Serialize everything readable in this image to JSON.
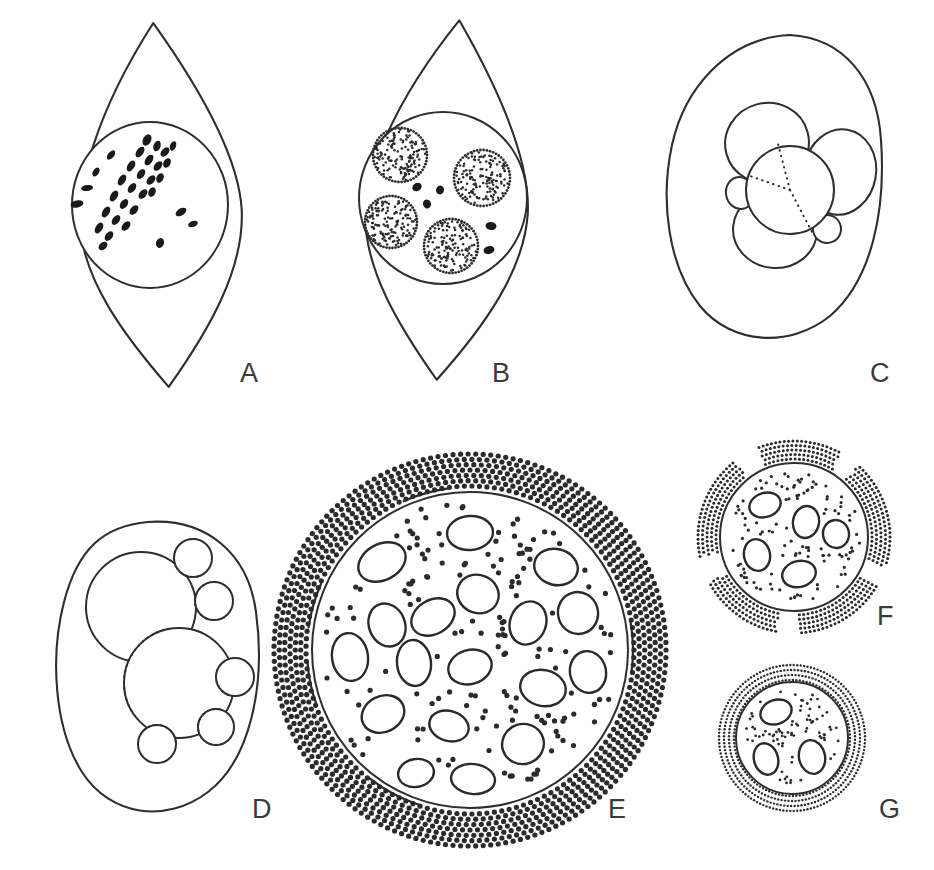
{
  "figure": {
    "panel_count": 7,
    "background_color": "#ffffff",
    "ink_color": "#2e2e2e",
    "width": 934,
    "height": 870
  },
  "panels": [
    {
      "id": "A",
      "label": "A",
      "label_x": 240,
      "label_y": 382,
      "description": "Spindle-shaped cell with circular nucleus containing dark metaphase chromosomes in a diagonal band",
      "cell_shape": "lemon",
      "cell": {
        "cx": 160,
        "cy": 205,
        "rx": 82,
        "ry": 182,
        "rotate": -4
      },
      "nucleus": {
        "cx": 150,
        "cy": 205,
        "rx": 78,
        "ry": 83
      },
      "chromosomes": [
        {
          "x": 111,
          "y": 155,
          "w": 11,
          "h": 6,
          "r": -50
        },
        {
          "x": 96,
          "y": 172,
          "w": 10,
          "h": 6,
          "r": -60
        },
        {
          "x": 87,
          "y": 188,
          "w": 12,
          "h": 6,
          "r": -8
        },
        {
          "x": 147,
          "y": 140,
          "w": 12,
          "h": 8,
          "r": -62
        },
        {
          "x": 157,
          "y": 146,
          "w": 11,
          "h": 7,
          "r": -70
        },
        {
          "x": 165,
          "y": 152,
          "w": 11,
          "h": 7,
          "r": -48
        },
        {
          "x": 173,
          "y": 146,
          "w": 10,
          "h": 6,
          "r": -70
        },
        {
          "x": 140,
          "y": 152,
          "w": 12,
          "h": 7,
          "r": -55
        },
        {
          "x": 149,
          "y": 160,
          "w": 12,
          "h": 7,
          "r": -56
        },
        {
          "x": 158,
          "y": 166,
          "w": 11,
          "h": 7,
          "r": -50
        },
        {
          "x": 167,
          "y": 163,
          "w": 10,
          "h": 7,
          "r": -62
        },
        {
          "x": 131,
          "y": 166,
          "w": 12,
          "h": 7,
          "r": -58
        },
        {
          "x": 141,
          "y": 174,
          "w": 11,
          "h": 7,
          "r": -55
        },
        {
          "x": 151,
          "y": 180,
          "w": 11,
          "h": 7,
          "r": -48
        },
        {
          "x": 160,
          "y": 178,
          "w": 10,
          "h": 7,
          "r": -64
        },
        {
          "x": 122,
          "y": 180,
          "w": 12,
          "h": 7,
          "r": -58
        },
        {
          "x": 132,
          "y": 188,
          "w": 11,
          "h": 7,
          "r": -54
        },
        {
          "x": 143,
          "y": 194,
          "w": 11,
          "h": 7,
          "r": -50
        },
        {
          "x": 152,
          "y": 192,
          "w": 10,
          "h": 7,
          "r": -66
        },
        {
          "x": 114,
          "y": 196,
          "w": 12,
          "h": 7,
          "r": -58
        },
        {
          "x": 124,
          "y": 204,
          "w": 11,
          "h": 7,
          "r": -56
        },
        {
          "x": 134,
          "y": 210,
          "w": 11,
          "h": 7,
          "r": -50
        },
        {
          "x": 106,
          "y": 212,
          "w": 12,
          "h": 7,
          "r": -58
        },
        {
          "x": 116,
          "y": 220,
          "w": 11,
          "h": 7,
          "r": -54
        },
        {
          "x": 126,
          "y": 226,
          "w": 11,
          "h": 7,
          "r": -48
        },
        {
          "x": 99,
          "y": 228,
          "w": 12,
          "h": 7,
          "r": -58
        },
        {
          "x": 109,
          "y": 236,
          "w": 11,
          "h": 7,
          "r": -52
        },
        {
          "x": 103,
          "y": 246,
          "w": 10,
          "h": 7,
          "r": -40
        },
        {
          "x": 77,
          "y": 204,
          "w": 13,
          "h": 7,
          "r": -12
        },
        {
          "x": 181,
          "y": 212,
          "w": 12,
          "h": 7,
          "r": -32
        },
        {
          "x": 193,
          "y": 224,
          "w": 10,
          "h": 6,
          "r": -20
        },
        {
          "x": 160,
          "y": 243,
          "w": 10,
          "h": 8,
          "r": -70
        }
      ]
    },
    {
      "id": "B",
      "label": "B",
      "label_x": 492,
      "label_y": 382,
      "description": "Spindle-shaped cell with nucleus containing four stippled nucleolar bodies and scattered dark chromatin fragments",
      "cell_shape": "lemon",
      "cell": {
        "cx": 447,
        "cy": 200,
        "rx": 82,
        "ry": 180,
        "rotate": 2
      },
      "nucleus": {
        "cx": 443,
        "cy": 198,
        "rx": 84,
        "ry": 86
      },
      "stippled_bodies": [
        {
          "cx": 400,
          "cy": 155,
          "r": 27
        },
        {
          "cx": 482,
          "cy": 178,
          "r": 28
        },
        {
          "cx": 391,
          "cy": 222,
          "r": 26
        },
        {
          "cx": 451,
          "cy": 246,
          "r": 27
        }
      ],
      "chromatin": [
        {
          "x": 417,
          "y": 187,
          "w": 10,
          "h": 8,
          "r": -35
        },
        {
          "x": 440,
          "y": 190,
          "w": 8,
          "h": 9,
          "r": 15
        },
        {
          "x": 427,
          "y": 204,
          "w": 8,
          "h": 9,
          "r": -20
        },
        {
          "x": 491,
          "y": 226,
          "w": 11,
          "h": 8,
          "r": 5
        },
        {
          "x": 489,
          "y": 250,
          "w": 11,
          "h": 8,
          "r": -15
        }
      ]
    },
    {
      "id": "C",
      "label": "C",
      "label_x": 870,
      "label_y": 382,
      "description": "Rounded cell containing a central sphere with a dotted three-ray cleavage pattern surrounded by three large lobes and two small lobes",
      "cell_shape": "teardrop",
      "cell_path": "M 790 35 C 843 38 877 78 881 140 C 886 210 872 280 830 316 C 790 348 732 345 700 306 C 668 266 660 200 672 145 C 684 90 726 38 790 35 Z",
      "central_sphere": {
        "cx": 790,
        "cy": 190,
        "r": 44
      },
      "rays": [
        {
          "x1": 790,
          "y1": 190,
          "x2": 778,
          "y2": 144
        },
        {
          "x1": 790,
          "y1": 190,
          "x2": 750,
          "y2": 176
        },
        {
          "x1": 790,
          "y1": 190,
          "x2": 812,
          "y2": 232
        }
      ],
      "lobes": [
        {
          "cx": 767,
          "cy": 143,
          "rx": 42,
          "ry": 40,
          "rotate": -15
        },
        {
          "cx": 840,
          "cy": 172,
          "rx": 36,
          "ry": 43,
          "rotate": 10
        },
        {
          "cx": 775,
          "cy": 230,
          "rx": 42,
          "ry": 38,
          "rotate": 5
        }
      ],
      "small_lobes": [
        {
          "cx": 740,
          "cy": 193,
          "rx": 14,
          "ry": 16,
          "rotate": -10
        },
        {
          "cx": 827,
          "cy": 229,
          "rx": 14,
          "ry": 14,
          "rotate": 20
        }
      ]
    },
    {
      "id": "D",
      "label": "D",
      "label_x": 252,
      "label_y": 818,
      "description": "Rounded cell containing two large overlapping spheres with five small budding spheres along their rims, hidden edges drawn dotted",
      "cell_shape": "teardrop",
      "cell_path": "M 148 522 C 205 518 248 552 256 612 C 266 686 250 760 208 792 C 166 824 110 816 82 772 C 54 728 50 656 64 602 C 78 548 104 526 148 522 Z",
      "spheres": [
        {
          "cx": 141,
          "cy": 607,
          "r": 55
        },
        {
          "cx": 179,
          "cy": 683,
          "r": 55
        }
      ],
      "hidden_arcs": [
        {
          "cx": 179,
          "cy": 683,
          "r": 55,
          "a1": 150,
          "a2": 265
        }
      ],
      "buds": [
        {
          "cx": 193,
          "cy": 558,
          "r": 19
        },
        {
          "cx": 214,
          "cy": 601,
          "r": 19
        },
        {
          "cx": 235,
          "cy": 677,
          "r": 19
        },
        {
          "cx": 216,
          "cy": 727,
          "r": 18
        },
        {
          "cx": 157,
          "cy": 744,
          "r": 19
        }
      ]
    },
    {
      "id": "E",
      "label": "E",
      "label_x": 608,
      "label_y": 818,
      "description": "Large mature cell: a stippled sphere packed with many elliptical nuclei, enclosed by a broad dense dotted halo ring",
      "sphere": {
        "cx": 470,
        "cy": 650,
        "r": 158
      },
      "halo": {
        "inner_r": 164,
        "outer_r": 196,
        "rows": 7,
        "dot_r": 2.6
      },
      "interior_dot_r": 2.6,
      "interior_dot_count": 150,
      "nuclei": [
        {
          "cx": 470,
          "cy": 533,
          "rx": 23,
          "ry": 17,
          "r": -4
        },
        {
          "cx": 382,
          "cy": 562,
          "rx": 25,
          "ry": 18,
          "r": -28
        },
        {
          "cx": 556,
          "cy": 567,
          "rx": 22,
          "ry": 18,
          "r": 14
        },
        {
          "cx": 478,
          "cy": 594,
          "rx": 21,
          "ry": 19,
          "r": 22
        },
        {
          "cx": 387,
          "cy": 625,
          "rx": 18,
          "ry": 22,
          "r": -22
        },
        {
          "cx": 433,
          "cy": 617,
          "rx": 23,
          "ry": 17,
          "r": -30
        },
        {
          "cx": 528,
          "cy": 623,
          "rx": 18,
          "ry": 22,
          "r": 20
        },
        {
          "cx": 578,
          "cy": 613,
          "rx": 20,
          "ry": 21,
          "r": -16
        },
        {
          "cx": 350,
          "cy": 657,
          "rx": 18,
          "ry": 24,
          "r": -8
        },
        {
          "cx": 414,
          "cy": 663,
          "rx": 17,
          "ry": 23,
          "r": -6
        },
        {
          "cx": 470,
          "cy": 667,
          "rx": 22,
          "ry": 17,
          "r": -16
        },
        {
          "cx": 543,
          "cy": 688,
          "rx": 23,
          "ry": 18,
          "r": 12
        },
        {
          "cx": 588,
          "cy": 672,
          "rx": 18,
          "ry": 21,
          "r": -12
        },
        {
          "cx": 383,
          "cy": 714,
          "rx": 22,
          "ry": 18,
          "r": -26
        },
        {
          "cx": 449,
          "cy": 726,
          "rx": 20,
          "ry": 15,
          "r": 16
        },
        {
          "cx": 523,
          "cy": 744,
          "rx": 21,
          "ry": 20,
          "r": -18
        },
        {
          "cx": 416,
          "cy": 773,
          "rx": 18,
          "ry": 14,
          "r": -10
        },
        {
          "cx": 473,
          "cy": 779,
          "rx": 22,
          "ry": 15,
          "r": 6
        }
      ],
      "boundary_marks": [
        {
          "a1": 108,
          "a2": 128
        },
        {
          "a1": 160,
          "a2": 176
        },
        {
          "a1": 188,
          "a2": 204
        },
        {
          "a1": 246,
          "a2": 262
        },
        {
          "a1": 350,
          "a2": 8
        }
      ]
    },
    {
      "id": "F",
      "label": "F",
      "label_x": 877,
      "label_y": 625,
      "description": "Medium sphere with stippled cytoplasm, five elliptical nuclei and a broken dotted outer ring",
      "sphere": {
        "cx": 794,
        "cy": 537,
        "r": 74
      },
      "halo": {
        "inner_r": 78,
        "outer_r": 96,
        "rows": 5,
        "dot_r": 1.5,
        "gaps": [
          [
            18,
            30
          ],
          [
            88,
            100
          ],
          [
            152,
            168
          ],
          [
            232,
            248
          ],
          [
            300,
            312
          ]
        ]
      },
      "interior_dot_r": 1.6,
      "interior_dot_count": 110,
      "nuclei": [
        {
          "cx": 765,
          "cy": 505,
          "rx": 16,
          "ry": 12,
          "r": -18
        },
        {
          "cx": 806,
          "cy": 522,
          "rx": 13,
          "ry": 16,
          "r": 10
        },
        {
          "cx": 836,
          "cy": 534,
          "rx": 13,
          "ry": 14,
          "r": -10
        },
        {
          "cx": 757,
          "cy": 555,
          "rx": 13,
          "ry": 16,
          "r": -12
        },
        {
          "cx": 799,
          "cy": 574,
          "rx": 17,
          "ry": 13,
          "r": -14
        }
      ],
      "boundary_marks": []
    },
    {
      "id": "G",
      "label": "G",
      "label_x": 879,
      "label_y": 818,
      "description": "Small sphere with stippled cytoplasm, three elliptical nuclei and a continuous fine dotted outer ring",
      "sphere": {
        "cx": 792,
        "cy": 738,
        "r": 56
      },
      "halo": {
        "inner_r": 58,
        "outer_r": 73,
        "rows": 4,
        "dot_r": 1.2
      },
      "interior_dot_r": 1.4,
      "interior_dot_count": 80,
      "nuclei": [
        {
          "cx": 776,
          "cy": 712,
          "rx": 16,
          "ry": 12,
          "r": -20
        },
        {
          "cx": 766,
          "cy": 759,
          "rx": 12,
          "ry": 16,
          "r": -16
        },
        {
          "cx": 812,
          "cy": 757,
          "rx": 13,
          "ry": 17,
          "r": -12
        }
      ],
      "boundary_marks": []
    }
  ]
}
